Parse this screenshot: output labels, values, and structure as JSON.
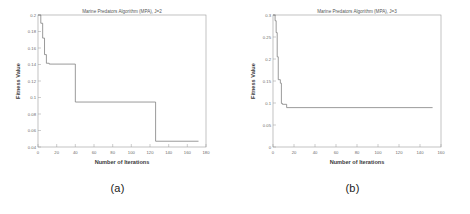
{
  "figure": {
    "panels": [
      {
        "caption": "(a)",
        "chart_data": {
          "type": "line",
          "title": "Marine Predators Algorithm (MPA), J=2",
          "xlabel": "Number of Iterations",
          "ylabel": "Fitness Value",
          "xlim": [
            0,
            180
          ],
          "ylim": [
            0.04,
            0.2
          ],
          "xticks": [
            0,
            20,
            40,
            60,
            80,
            100,
            120,
            140,
            160,
            180
          ],
          "xticklabels": [
            "0",
            "20",
            "40",
            "60",
            "80",
            "100",
            "120",
            "140",
            "160",
            "180"
          ],
          "yticks": [
            0.04,
            0.06,
            0.08,
            0.1,
            0.12,
            0.14,
            0.16,
            0.18,
            0.2
          ],
          "yticklabels": [
            "0.04",
            "0.06",
            "0.08",
            "0.1",
            "0.12",
            "0.14",
            "0.16",
            "0.18",
            "0.2"
          ],
          "grid": false,
          "legend": null,
          "line_color": "#7a7a7a",
          "series": [
            {
              "name": "MPA J=2 best fitness",
              "x": [
                0,
                3,
                3,
                5,
                5,
                7,
                7,
                9,
                9,
                12,
                12,
                40,
                40,
                126,
                126,
                172
              ],
              "y": [
                0.2,
                0.2,
                0.19,
                0.19,
                0.172,
                0.172,
                0.152,
                0.152,
                0.1415,
                0.1415,
                0.1405,
                0.1405,
                0.0945,
                0.0945,
                0.047,
                0.047
              ]
            }
          ]
        }
      },
      {
        "caption": "(b)",
        "chart_data": {
          "type": "line",
          "title": "Marine Predators Algorithm (MPA), J=3",
          "xlabel": "Number of Iterations",
          "ylabel": "Fitness Value",
          "xlim": [
            0,
            160
          ],
          "ylim": [
            0,
            0.3
          ],
          "xticks": [
            0,
            20,
            40,
            60,
            80,
            100,
            120,
            140,
            160
          ],
          "xticklabels": [
            "0",
            "20",
            "40",
            "60",
            "80",
            "100",
            "120",
            "140",
            "160"
          ],
          "yticks": [
            0,
            0.05,
            0.1,
            0.15,
            0.2,
            0.25,
            0.3
          ],
          "yticklabels": [
            "0",
            "0.05",
            "0.1",
            "0.15",
            "0.2",
            "0.25",
            "0.3"
          ],
          "grid": false,
          "legend": null,
          "line_color": "#7a7a7a",
          "series": [
            {
              "name": "MPA J=3 best fitness",
              "x": [
                0,
                2,
                2,
                3,
                3,
                4,
                4,
                5,
                5,
                7,
                7,
                8,
                8,
                9,
                9,
                13,
                13,
                152
              ],
              "y": [
                0.3,
                0.3,
                0.287,
                0.287,
                0.26,
                0.26,
                0.205,
                0.205,
                0.153,
                0.153,
                0.145,
                0.145,
                0.099,
                0.099,
                0.097,
                0.097,
                0.0895,
                0.0895
              ]
            }
          ]
        }
      }
    ]
  }
}
